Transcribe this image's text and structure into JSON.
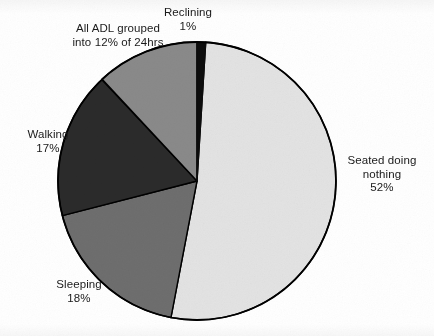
{
  "chart_data": {
    "type": "pie",
    "title": "",
    "subtitle": "",
    "xlabel": "",
    "ylabel": "",
    "legend_position": "none",
    "grid": false,
    "labels_outside": true,
    "start_angle_deg": 0,
    "direction": "clockwise",
    "categories": [
      "Reclining",
      "Seated doing nothing",
      "Sleeping",
      "Walking",
      "All ADL grouped into 12% of 24hrs"
    ],
    "values": [
      1,
      52,
      18,
      17,
      12
    ],
    "value_labels": [
      "1%",
      "52%",
      "18%",
      "17%",
      "12%"
    ],
    "units": "percent",
    "total": 100,
    "slices": [
      {
        "name": "Reclining",
        "label_lines": [
          "Reclining",
          "1%"
        ],
        "value": 1,
        "value_label": "1%",
        "color": "#0d0d0d",
        "start_deg": 0,
        "end_deg": 3.6
      },
      {
        "name": "Seated doing nothing",
        "label_lines": [
          "Seated doing",
          "nothing",
          "52%"
        ],
        "value": 52,
        "value_label": "52%",
        "color": "#e3e3e3",
        "start_deg": 3.6,
        "end_deg": 190.8
      },
      {
        "name": "Sleeping",
        "label_lines": [
          "Sleeping",
          "18%"
        ],
        "value": 18,
        "value_label": "18%",
        "color": "#6e6e6e",
        "start_deg": 190.8,
        "end_deg": 255.6
      },
      {
        "name": "Walking",
        "label_lines": [
          "Walking",
          "17%"
        ],
        "value": 17,
        "value_label": "17%",
        "color": "#2b2b2b",
        "start_deg": 255.6,
        "end_deg": 316.8
      },
      {
        "name": "All ADL grouped into 12% of 24hrs",
        "label_lines": [
          "All ADL grouped",
          "into 12% of 24hrs"
        ],
        "value": 12,
        "value_label": "12%",
        "color": "#8a8a8a",
        "start_deg": 316.8,
        "end_deg": 360
      }
    ]
  },
  "labels": {
    "reclining": {
      "line1": "Reclining",
      "line2": "1%"
    },
    "adl": {
      "line1": "All ADL grouped",
      "line2": "into 12% of 24hrs"
    },
    "walking": {
      "line1": "Walking",
      "line2": "17%"
    },
    "sleeping": {
      "line1": "Sleeping",
      "line2": "18%"
    },
    "seated": {
      "line1": "Seated doing",
      "line2": "nothing",
      "line3": "52%"
    }
  },
  "style": {
    "background": "#ffffff",
    "outline_color": "#000000",
    "text_color": "#1a1a1a",
    "slice_colors": {
      "reclining": "#0d0d0d",
      "seated": "#e3e3e3",
      "sleeping": "#6e6e6e",
      "walking": "#2b2b2b",
      "adl": "#8a8a8a"
    }
  },
  "geometry": {
    "center_x": 197,
    "center_y": 181,
    "radius": 139
  }
}
